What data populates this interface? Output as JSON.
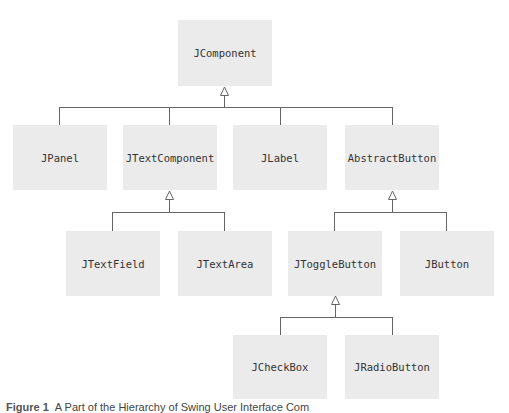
{
  "diagram": {
    "nodes": {
      "jcomponent": "JComponent",
      "jpanel": "JPanel",
      "jtextcomponent": "JTextComponent",
      "jlabel": "JLabel",
      "abstractbutton": "AbstractButton",
      "jtextfield": "JTextField",
      "jtextarea": "JTextArea",
      "jtogglebutton": "JToggleButton",
      "jbutton": "JButton",
      "jcheckbox": "JCheckBox",
      "jradiobutton": "JRadioButton"
    },
    "edges": [
      {
        "from": "JPanel",
        "to": "JComponent"
      },
      {
        "from": "JTextComponent",
        "to": "JComponent"
      },
      {
        "from": "JLabel",
        "to": "JComponent"
      },
      {
        "from": "AbstractButton",
        "to": "JComponent"
      },
      {
        "from": "JTextField",
        "to": "JTextComponent"
      },
      {
        "from": "JTextArea",
        "to": "JTextComponent"
      },
      {
        "from": "JToggleButton",
        "to": "AbstractButton"
      },
      {
        "from": "JButton",
        "to": "AbstractButton"
      },
      {
        "from": "JCheckBox",
        "to": "JToggleButton"
      },
      {
        "from": "JRadioButton",
        "to": "JToggleButton"
      }
    ],
    "colors": {
      "box": "#ebebeb",
      "line": "#666666",
      "text": "#333333"
    }
  },
  "caption": {
    "number": "Figure 1",
    "text": "A Part of the Hierarchy of Swing User Interface Com"
  }
}
